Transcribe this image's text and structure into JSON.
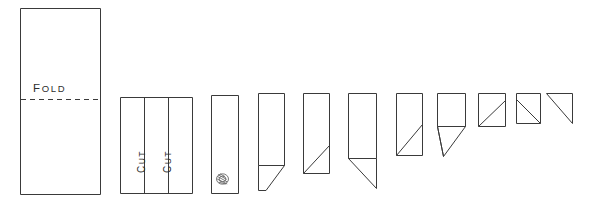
{
  "diagram": {
    "type": "instructional-line-diagram",
    "background_color": "#ffffff",
    "line_color": "#3a3a3a",
    "canvas": {
      "width": 593,
      "height": 204
    },
    "labels": {
      "fold": {
        "text": "FOLD",
        "first_letter": "F",
        "rest": "OLD"
      },
      "cut_left": {
        "text": "CUT",
        "first_letter": "C",
        "rest": "UT"
      },
      "cut_right": {
        "text": "CUT",
        "first_letter": "C",
        "rest": "UT"
      }
    },
    "figures": [
      {
        "index": 1,
        "name": "sheet-with-fold-line",
        "description": "Tall rectangle with horizontal dashed fold line labeled FOLD",
        "x": 20,
        "y": 8,
        "width": 80,
        "height": 186,
        "fold_line_y": 99
      },
      {
        "index": 2,
        "name": "folded-sheet-with-cut-lines",
        "description": "Rectangle divided by two vertical cut lines labeled CUT",
        "x": 120,
        "y": 97,
        "width": 72,
        "height": 97,
        "cut_line_x": [
          144,
          168
        ]
      },
      {
        "index": 3,
        "name": "narrow-strip-with-mark",
        "description": "Narrow vertical strip with small scribbled mark near bottom",
        "x": 211,
        "y": 95,
        "width": 27,
        "height": 99,
        "mark_x": 222,
        "mark_y": 179
      },
      {
        "index": 4,
        "name": "strip-with-flap-folded-down-left",
        "description": "Strip with diagonal flap extending below to the left",
        "x": 258,
        "y": 93,
        "width": 26,
        "height": 72
      },
      {
        "index": 5,
        "name": "strip-with-internal-diagonal",
        "description": "Strip with internal diagonal crease from bottom-left to mid-right",
        "x": 303,
        "y": 93,
        "width": 26,
        "height": 80
      },
      {
        "index": 6,
        "name": "strip-with-long-flap",
        "description": "Shorter strip with long diagonal flap hanging below right",
        "x": 348,
        "y": 93,
        "width": 28,
        "height": 65
      },
      {
        "index": 7,
        "name": "short-rect-with-diagonal",
        "description": "Short rectangle with diagonal crease corner to corner",
        "x": 396,
        "y": 93,
        "width": 26,
        "height": 62
      },
      {
        "index": 8,
        "name": "square-with-triangular-flap",
        "description": "Square with triangular flap below-left",
        "x": 437,
        "y": 93,
        "width": 28,
        "height": 33
      },
      {
        "index": 9,
        "name": "square-with-diagonal",
        "description": "Square with diagonal crease",
        "x": 478,
        "y": 93,
        "width": 27,
        "height": 33
      },
      {
        "index": 10,
        "name": "small-square-with-diagonal",
        "description": "Small square with diagonal crease",
        "x": 516,
        "y": 93,
        "width": 24,
        "height": 30
      },
      {
        "index": 11,
        "name": "final-triangle",
        "description": "Final folded triangle",
        "x": 546,
        "y": 93,
        "width": 26,
        "height": 30
      }
    ]
  }
}
